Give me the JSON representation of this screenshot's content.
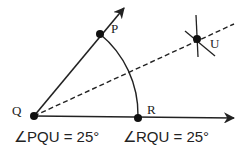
{
  "diagram": {
    "points": {
      "Q": {
        "label": "Q",
        "x": 34,
        "y": 116
      },
      "P": {
        "label": "P",
        "x": 100,
        "y": 34
      },
      "R": {
        "label": "R",
        "x": 138,
        "y": 118
      },
      "U": {
        "label": "U",
        "x": 197,
        "y": 39
      }
    },
    "equations": [
      {
        "text": "∠PQU = 25°"
      },
      {
        "text": "∠RQU = 25°"
      }
    ],
    "colors": {
      "stroke": "#222222",
      "background": "#ffffff"
    }
  }
}
